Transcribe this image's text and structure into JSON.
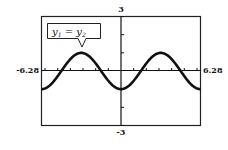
{
  "chart_data": {
    "type": "line",
    "title": "",
    "xlabel": "",
    "ylabel": "",
    "xlim": [
      -6.28,
      6.28
    ],
    "ylim": [
      -3,
      3
    ],
    "x_tick_step": 1,
    "y_tick_step": 1,
    "grid": false,
    "legend": null,
    "tick_labels": {
      "xmin": "-6.28",
      "xmax": "6.28",
      "ymax": "3",
      "ymin": "-3"
    },
    "annotation": {
      "text_main": "y",
      "sub1": "1",
      "equals": " = ",
      "text_main2": "y",
      "sub2": "2",
      "full": "y1 = y2",
      "points_to": [
        -3.14,
        1
      ]
    },
    "series": [
      {
        "name": "y1 = y2",
        "function": "-cos(x)",
        "x": [
          -6.28,
          -4.71,
          -3.14,
          -1.57,
          0,
          1.57,
          3.14,
          4.71,
          6.28
        ],
        "values": [
          -1,
          0,
          1,
          0,
          -1,
          0,
          1,
          0,
          -1
        ]
      }
    ]
  }
}
